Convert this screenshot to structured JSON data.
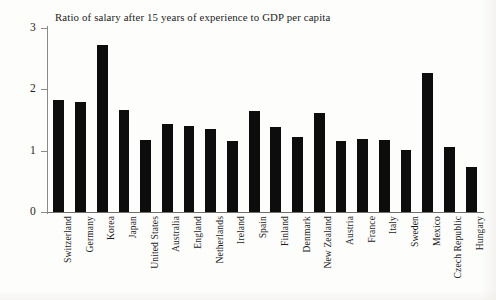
{
  "chart_data": {
    "type": "bar",
    "title": "Ratio of salary after 15 years of experience to GDP per capita",
    "xlabel": "",
    "ylabel": "",
    "ylim": [
      0,
      3
    ],
    "yticks": [
      "0",
      "1",
      "2",
      "3"
    ],
    "grid": false,
    "legend": null,
    "bar_color": "#0d0d0d",
    "categories": [
      "Switzerland",
      "Germany",
      "Korea",
      "Japan",
      "United States",
      "Australia",
      "England",
      "Netherlands",
      "Ireland",
      "Spain",
      "Finland",
      "Denmark",
      "New Zealand",
      "Austria",
      "France",
      "Italy",
      "Sweden",
      "Mexico",
      "Czech Republic",
      "Hungary"
    ],
    "values": [
      1.82,
      1.8,
      2.73,
      1.66,
      1.18,
      1.44,
      1.4,
      1.35,
      1.15,
      1.65,
      1.38,
      1.22,
      1.61,
      1.15,
      1.19,
      1.17,
      1.01,
      2.26,
      1.06,
      0.73
    ]
  }
}
